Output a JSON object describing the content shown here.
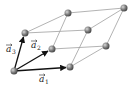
{
  "diagram": {
    "colors": {
      "edge": "#9a9a9a",
      "vector": "#111111",
      "node": "#6e6e6e",
      "node_highlight": "#bdbdbd"
    },
    "nodes": [
      {
        "id": "O",
        "x": 14,
        "y": 71
      },
      {
        "id": "a1",
        "x": 70,
        "y": 67
      },
      {
        "id": "a2",
        "x": 52,
        "y": 49
      },
      {
        "id": "a3",
        "x": 25,
        "y": 33
      },
      {
        "id": "a1a2",
        "x": 106,
        "y": 46
      },
      {
        "id": "a1a3",
        "x": 88,
        "y": 30
      },
      {
        "id": "a2a3",
        "x": 68,
        "y": 13
      },
      {
        "id": "a1a2a3",
        "x": 124,
        "y": 8
      }
    ],
    "vectors": [
      {
        "name": "a1",
        "label": "a",
        "subscript": "1",
        "label_x": 42,
        "label_y": 83
      },
      {
        "name": "a2",
        "label": "a",
        "subscript": "2",
        "label_x": 31,
        "label_y": 49
      },
      {
        "name": "a3",
        "label": "a",
        "subscript": "3",
        "label_x": 7,
        "label_y": 47
      }
    ]
  }
}
